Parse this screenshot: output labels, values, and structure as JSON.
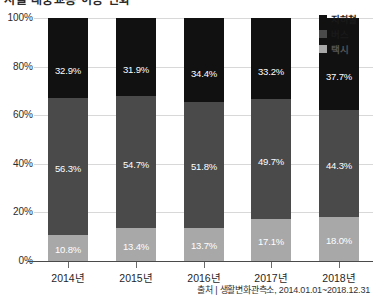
{
  "title_remnant": "서울 대중교통 이용 변화",
  "chart_data": {
    "type": "bar",
    "subtype": "stacked-100-percent",
    "title": "",
    "xlabel": "",
    "ylabel": "",
    "ylim": [
      0,
      100
    ],
    "ytick_labels": [
      "100%",
      "80%",
      "60%",
      "40%",
      "20%",
      "0%"
    ],
    "ytick_values": [
      100,
      80,
      60,
      40,
      20,
      0
    ],
    "grid": true,
    "legend_position": "top-right",
    "categories": [
      "2014년",
      "2015년",
      "2016년",
      "2017년",
      "2018년"
    ],
    "series": [
      {
        "name": "지하철",
        "color": "#111111",
        "values": [
          32.9,
          31.9,
          34.4,
          33.2,
          37.7
        ],
        "labels": [
          "32.9%",
          "31.9%",
          "34.4%",
          "33.2%",
          "37.7%"
        ]
      },
      {
        "name": "버스",
        "color": "#4a4a4a",
        "values": [
          56.3,
          54.7,
          51.8,
          49.7,
          44.3
        ],
        "labels": [
          "56.3%",
          "54.7%",
          "51.8%",
          "49.7%",
          "44.3%"
        ]
      },
      {
        "name": "택시",
        "color": "#a8a8a8",
        "values": [
          10.8,
          13.4,
          13.7,
          17.1,
          18.0
        ],
        "labels": [
          "10.8%",
          "13.4%",
          "13.7%",
          "17.1%",
          "18.0%"
        ]
      }
    ]
  },
  "legend": {
    "items": [
      {
        "label": "지하철",
        "color": "#111111"
      },
      {
        "label": "버스",
        "color": "#4a4a4a"
      },
      {
        "label": "택시",
        "color": "#a8a8a8"
      }
    ]
  },
  "source": {
    "text": "출처 | 생활변화관측소, 2014.01.01~2018.12.31"
  }
}
